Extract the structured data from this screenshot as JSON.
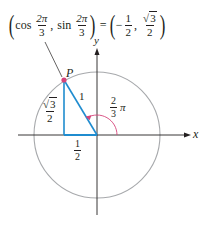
{
  "figure": {
    "title_equation": {
      "lhs_func1": "cos",
      "lhs_arg1_num": "2π",
      "lhs_arg1_den": "3",
      "separator": ",",
      "lhs_func2": "sin",
      "lhs_arg2_num": "2π",
      "lhs_arg2_den": "3",
      "equals": "=",
      "rhs_x_sign": "−",
      "rhs_x_num": "1",
      "rhs_x_den": "2",
      "rhs_y_sqrt": "√",
      "rhs_y_radicand": "3",
      "rhs_y_den": "2",
      "open_paren": "(",
      "close_paren": ")"
    },
    "axes": {
      "x_label": "x",
      "y_label": "y"
    },
    "point_label": "P",
    "hypotenuse_label": "1",
    "vertical_leg_label": {
      "sqrt": "√",
      "radicand": "3",
      "den": "2"
    },
    "horizontal_leg_label": {
      "num": "1",
      "den": "2"
    },
    "angle_label": {
      "num": "2",
      "den": "3",
      "symbol": "π"
    },
    "colors": {
      "circle": "#a7a9ac",
      "axes": "#231f20",
      "triangle": "#1f8ccf",
      "angle_arc": "#d6457a",
      "point": "#d6457a",
      "text": "#231f20"
    },
    "geometry": {
      "center": [
        97,
        135
      ],
      "radius": 63,
      "angle_deg": 120
    }
  }
}
